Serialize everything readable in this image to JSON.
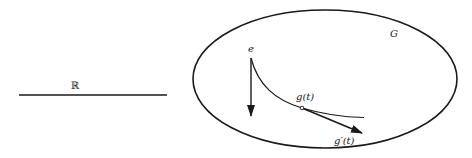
{
  "diagram": {
    "real_line": {
      "label": "ℝ"
    },
    "group": {
      "label": "G"
    },
    "identity": {
      "label": "e"
    },
    "curve_point": {
      "label": "g(t)"
    },
    "tangent_vector": {
      "label": "g′(t)"
    },
    "colors": {
      "stroke": "#1a1a1a",
      "background": "#ffffff"
    }
  }
}
